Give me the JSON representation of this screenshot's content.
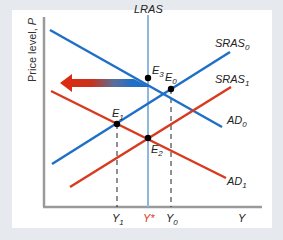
{
  "diagram": {
    "title": "",
    "y_axis_label_text": "Price level, ",
    "y_axis_label_var": "P",
    "x_axis_label": "Y",
    "lras_label": "LRAS",
    "curves": {
      "sras0": {
        "name": "SRAS",
        "sub": "0",
        "color": "#1f6fc6"
      },
      "sras1": {
        "name": "SRAS",
        "sub": "1",
        "color": "#d93a1f"
      },
      "ad0": {
        "name": "AD",
        "sub": "0",
        "color": "#1f6fc6"
      },
      "ad1": {
        "name": "AD",
        "sub": "1",
        "color": "#d93a1f"
      },
      "lras": {
        "name": "LRAS",
        "color": "#8fb8e0"
      }
    },
    "points": {
      "e0": {
        "name": "E",
        "sub": "0"
      },
      "e1": {
        "name": "E",
        "sub": "1"
      },
      "e2": {
        "name": "E",
        "sub": "2"
      },
      "e3": {
        "name": "E",
        "sub": "3"
      }
    },
    "x_ticks": {
      "y1": {
        "name": "Y",
        "sub": "1"
      },
      "ystar": {
        "name": "Y*",
        "color": "#d93a1f"
      },
      "y0": {
        "name": "Y",
        "sub": "0"
      }
    },
    "arrow": {
      "direction": "left",
      "from_color": "#1f6fc6",
      "to_color": "#e02a10"
    }
  }
}
